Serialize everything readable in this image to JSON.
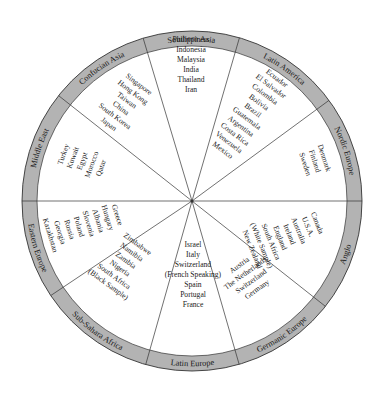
{
  "diagram": {
    "colors": {
      "ring_fill": "#b3b3b3",
      "line": "#333333",
      "text": "#1a1a1a",
      "background": "#ffffff"
    },
    "geometry": {
      "cx": 192,
      "cy": 201,
      "outer_r": 170,
      "inner_r": 155
    },
    "clusters": [
      {
        "name": "Southern Asia",
        "start_deg": 253.3,
        "end_deg": 286.2,
        "countries": [
          "Philippiness",
          "Indonesia",
          "Malaysia",
          "India",
          "Thailand",
          "Iran"
        ],
        "text_x": 191,
        "text_y": 64,
        "text_rot": 0
      },
      {
        "name": "Latin America",
        "start_deg": 286.2,
        "end_deg": 323.7,
        "countries": [
          "Ecuador",
          "El Salvador",
          "Colombia",
          "Bolivia",
          "Brazil",
          "Guatemala",
          "Argentina",
          "Costa Rica",
          "Venezuela",
          "Mexico"
        ],
        "text_x": 250,
        "text_y": 114,
        "text_rot": 37
      },
      {
        "name": "Nordic Europe",
        "start_deg": 323.7,
        "end_deg": 360,
        "countries": [
          "Denmark",
          "Finland",
          "Sweden"
        ],
        "text_x": 315,
        "text_y": 161,
        "text_rot": 72
      },
      {
        "name": "Anglo",
        "start_deg": 0,
        "end_deg": 38.3,
        "countries": [
          "Canada",
          "U.S.A.",
          "Australia",
          "Ireland",
          "England",
          "South Africa",
          "(White Sample)",
          "New Zealand"
        ],
        "text_x": 285,
        "text_y": 236,
        "text_rot": 68
      },
      {
        "name": "Germanic Europe",
        "start_deg": 38.3,
        "end_deg": 73.9,
        "countries": [
          "Austria",
          "The Netherlands",
          "Switzerland",
          "Germany"
        ],
        "text_x": 248,
        "text_y": 277,
        "text_rot": -36
      },
      {
        "name": "Latin Europe",
        "start_deg": 73.9,
        "end_deg": 105.8,
        "countries": [
          "Israel",
          "Italy",
          "Switzerland",
          "(French Speaking)",
          "Spain",
          "Portugal",
          "France"
        ],
        "text_x": 193,
        "text_y": 274,
        "text_rot": 0
      },
      {
        "name": "Sub-Sahara Africa",
        "start_deg": 105.8,
        "end_deg": 146.2,
        "countries": [
          "Zimbabwe",
          "Namibia",
          "Zambia",
          "Nigeria",
          "South Africa",
          "(Black Sample)"
        ],
        "text_x": 123,
        "text_y": 264,
        "text_rot": 36
      },
      {
        "name": "Eastern Europe",
        "start_deg": 146.2,
        "end_deg": 180,
        "countries": [
          "Greece",
          "Hungary",
          "Albania",
          "Slovenia",
          "Poland",
          "Russia",
          "Georgia",
          "Kazakhstan"
        ],
        "text_x": 84,
        "text_y": 225,
        "text_rot": 73
      },
      {
        "name": "Middle East",
        "start_deg": 180,
        "end_deg": 218.3,
        "countries": [
          "Turkey",
          "Kuwait",
          "Egypt",
          "Morocco",
          "Qatar"
        ],
        "text_x": 82,
        "text_y": 161,
        "text_rot": -70
      },
      {
        "name": "Confucian Asia",
        "start_deg": 218.3,
        "end_deg": 253.3,
        "countries": [
          "Singapore",
          "Hong Kong",
          "Taiwan",
          "China",
          "South Korea",
          "Japan"
        ],
        "text_x": 124,
        "text_y": 104,
        "text_rot": 37
      }
    ]
  }
}
